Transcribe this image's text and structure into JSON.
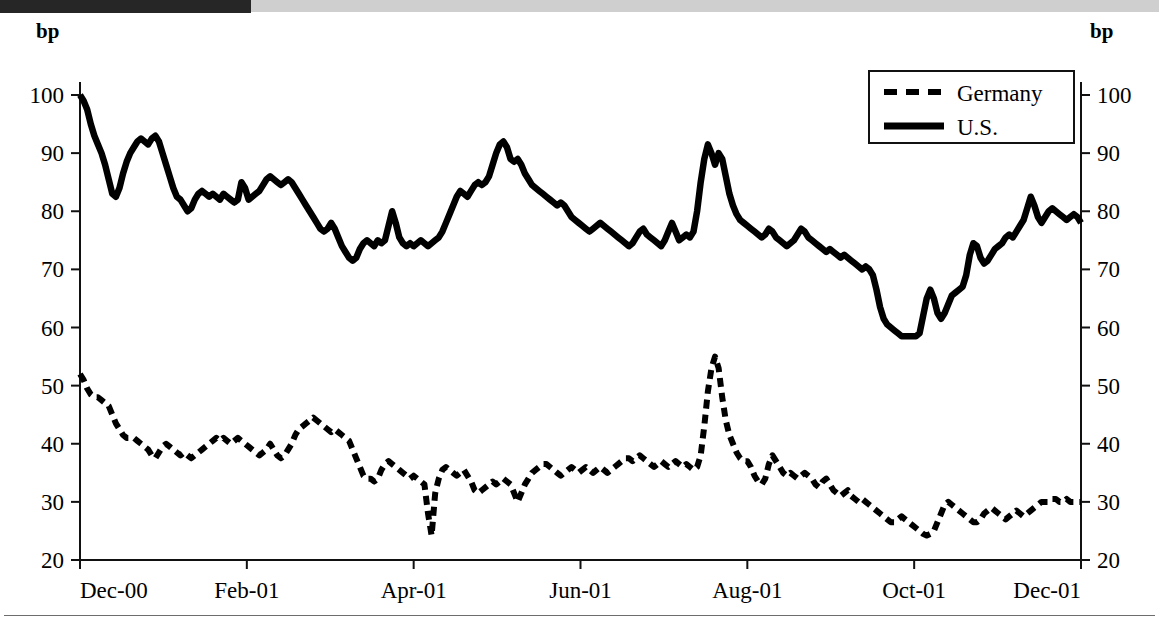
{
  "titlebar": {
    "obscured_text": "",
    "dark_block_color": "#262626",
    "band_color": "#cfcfcf"
  },
  "chart_data": {
    "type": "line",
    "title": "",
    "subtitle": "",
    "xlabel": "",
    "ylabel": "bp",
    "ylabel_right": "bp",
    "ylim": [
      20,
      100
    ],
    "yticks": [
      20,
      30,
      40,
      50,
      60,
      70,
      80,
      90,
      100
    ],
    "ytick_labels": [
      "20",
      "30",
      "40",
      "50",
      "60",
      "70",
      "80",
      "90",
      "100"
    ],
    "ytick_labels_right": [
      "20",
      "30",
      "40",
      "50",
      "60",
      "70",
      "80",
      "90",
      "100"
    ],
    "xtick_labels": [
      "Dec-00",
      "Feb-01",
      "Apr-01",
      "Jun-01",
      "Aug-01",
      "Oct-01",
      "Dec-01"
    ],
    "xlim": [
      0,
      12
    ],
    "grid": false,
    "legend_position": "top-right",
    "line_color": "#000000",
    "series": [
      {
        "name": "U.S.",
        "style": "solid",
        "values": [
          100.0,
          99.0,
          97.5,
          95.0,
          93.0,
          91.5,
          90.0,
          88.0,
          85.5,
          83.0,
          82.5,
          84.0,
          86.5,
          88.5,
          90.0,
          91.0,
          92.0,
          92.5,
          92.0,
          91.5,
          92.5,
          93.0,
          92.0,
          90.0,
          88.0,
          86.0,
          84.0,
          82.5,
          82.0,
          81.0,
          80.0,
          80.5,
          82.0,
          83.0,
          83.5,
          83.0,
          82.5,
          83.0,
          82.5,
          82.0,
          83.0,
          82.5,
          82.0,
          81.5,
          82.0,
          85.0,
          84.0,
          82.0,
          82.5,
          83.0,
          83.5,
          84.5,
          85.5,
          86.0,
          85.5,
          85.0,
          84.5,
          85.0,
          85.5,
          85.0,
          84.0,
          83.0,
          82.0,
          81.0,
          80.0,
          79.0,
          78.0,
          77.0,
          76.5,
          77.0,
          78.0,
          77.0,
          75.5,
          74.0,
          73.0,
          72.0,
          71.5,
          72.0,
          73.5,
          74.5,
          75.0,
          74.5,
          74.0,
          75.0,
          74.5,
          75.0,
          77.5,
          80.0,
          78.0,
          75.5,
          74.5,
          74.0,
          74.5,
          74.0,
          74.5,
          75.0,
          74.5,
          74.0,
          74.5,
          75.0,
          75.5,
          76.5,
          78.0,
          79.5,
          81.0,
          82.5,
          83.5,
          83.0,
          82.5,
          83.5,
          84.5,
          85.0,
          84.5,
          85.0,
          86.0,
          88.0,
          90.0,
          91.5,
          92.0,
          91.0,
          89.0,
          88.5,
          89.0,
          88.0,
          86.5,
          85.5,
          84.5,
          84.0,
          83.5,
          83.0,
          82.5,
          82.0,
          81.5,
          81.0,
          81.5,
          81.0,
          80.0,
          79.0,
          78.5,
          78.0,
          77.5,
          77.0,
          76.5,
          77.0,
          77.5,
          78.0,
          77.5,
          77.0,
          76.5,
          76.0,
          75.5,
          75.0,
          74.5,
          74.0,
          74.5,
          75.5,
          76.5,
          77.0,
          76.0,
          75.5,
          75.0,
          74.5,
          74.0,
          75.0,
          76.5,
          78.0,
          76.5,
          75.0,
          75.5,
          76.0,
          75.5,
          76.5,
          80.0,
          85.0,
          89.0,
          91.5,
          90.0,
          88.0,
          90.0,
          89.0,
          86.0,
          83.0,
          81.0,
          79.5,
          78.5,
          78.0,
          77.5,
          77.0,
          76.5,
          76.0,
          75.5,
          76.0,
          77.0,
          76.5,
          75.5,
          75.0,
          74.5,
          74.0,
          74.5,
          75.0,
          76.0,
          77.0,
          76.5,
          75.5,
          75.0,
          74.5,
          74.0,
          73.5,
          73.0,
          73.5,
          73.0,
          72.5,
          72.0,
          72.5,
          72.0,
          71.5,
          71.0,
          70.5,
          70.0,
          70.5,
          70.0,
          69.0,
          66.5,
          63.5,
          61.5,
          60.5,
          60.0,
          59.5,
          59.0,
          58.5,
          58.5,
          58.5,
          58.5,
          58.5,
          59.0,
          62.0,
          65.0,
          66.5,
          65.0,
          62.5,
          61.5,
          62.5,
          64.0,
          65.5,
          66.0,
          66.5,
          67.0,
          69.0,
          72.5,
          74.5,
          74.0,
          72.0,
          71.0,
          71.5,
          72.5,
          73.5,
          74.0,
          74.5,
          75.5,
          76.0,
          75.5,
          76.5,
          77.5,
          78.5,
          80.5,
          82.5,
          81.0,
          79.0,
          78.0,
          79.0,
          80.0,
          80.5,
          80.0,
          79.5,
          79.0,
          78.5,
          79.0,
          79.5,
          79.0,
          78.0
        ]
      },
      {
        "name": "Germany",
        "style": "dashed",
        "values": [
          52.0,
          51.0,
          49.5,
          48.5,
          48.0,
          48.0,
          47.5,
          47.0,
          46.5,
          45.0,
          43.5,
          42.5,
          41.5,
          41.0,
          41.0,
          41.0,
          40.5,
          40.0,
          39.5,
          39.0,
          38.0,
          37.5,
          38.5,
          39.5,
          40.0,
          39.5,
          39.0,
          38.5,
          38.0,
          38.5,
          38.0,
          37.5,
          38.0,
          38.5,
          39.0,
          39.5,
          40.0,
          40.5,
          41.0,
          40.5,
          41.0,
          40.5,
          40.0,
          40.5,
          41.0,
          40.5,
          40.0,
          39.5,
          39.0,
          38.5,
          38.0,
          38.5,
          39.0,
          40.0,
          39.0,
          38.0,
          37.5,
          38.0,
          39.0,
          40.0,
          41.5,
          42.5,
          43.0,
          43.5,
          44.0,
          44.5,
          44.0,
          43.5,
          43.0,
          42.5,
          42.0,
          42.5,
          42.0,
          41.5,
          41.0,
          40.5,
          39.0,
          37.5,
          36.0,
          34.5,
          34.0,
          34.0,
          33.5,
          34.0,
          35.5,
          36.5,
          37.0,
          36.5,
          36.0,
          35.5,
          35.0,
          34.5,
          34.0,
          34.5,
          34.0,
          33.5,
          33.0,
          28.0,
          24.2,
          31.5,
          34.0,
          35.5,
          36.0,
          35.5,
          35.0,
          34.5,
          35.0,
          35.5,
          34.5,
          33.5,
          32.0,
          31.5,
          32.0,
          32.5,
          33.0,
          33.5,
          33.0,
          33.5,
          34.0,
          33.5,
          33.0,
          31.5,
          30.0,
          31.5,
          33.0,
          34.0,
          35.0,
          35.5,
          36.0,
          36.5,
          36.5,
          36.0,
          35.5,
          35.0,
          34.5,
          35.0,
          35.5,
          36.0,
          35.5,
          35.0,
          35.5,
          36.0,
          35.5,
          35.0,
          35.5,
          36.0,
          35.5,
          35.0,
          35.5,
          36.0,
          36.5,
          37.0,
          37.5,
          37.5,
          37.0,
          37.5,
          38.0,
          37.5,
          37.0,
          36.5,
          36.0,
          36.5,
          37.0,
          36.5,
          36.0,
          36.5,
          37.0,
          36.5,
          36.0,
          36.5,
          36.0,
          35.5,
          36.0,
          38.0,
          43.0,
          49.0,
          53.0,
          55.0,
          53.0,
          48.0,
          44.0,
          41.5,
          40.0,
          38.5,
          37.5,
          37.0,
          37.0,
          36.0,
          34.5,
          33.5,
          33.0,
          34.0,
          36.5,
          38.0,
          37.0,
          36.0,
          35.0,
          34.5,
          35.0,
          34.5,
          34.0,
          34.5,
          35.0,
          34.5,
          34.0,
          33.0,
          32.5,
          33.5,
          34.0,
          33.0,
          32.0,
          31.5,
          31.0,
          31.5,
          32.0,
          31.0,
          30.5,
          30.0,
          30.5,
          30.0,
          29.5,
          29.0,
          28.5,
          28.0,
          27.5,
          27.0,
          26.5,
          26.5,
          27.0,
          27.5,
          27.0,
          26.5,
          26.0,
          25.5,
          25.0,
          24.5,
          24.2,
          24.5,
          25.0,
          26.5,
          28.0,
          29.5,
          30.0,
          29.5,
          29.0,
          28.5,
          28.0,
          27.5,
          27.0,
          26.5,
          26.5,
          27.0,
          28.0,
          28.5,
          29.0,
          28.5,
          28.0,
          27.5,
          27.0,
          27.5,
          28.0,
          28.5,
          28.0,
          27.5,
          28.0,
          28.5,
          29.0,
          29.5,
          30.0,
          30.0,
          30.0,
          30.5,
          30.5,
          30.0,
          30.0,
          30.5,
          30.0,
          30.0,
          30.0,
          30.0
        ]
      }
    ],
    "legend": [
      {
        "label": "Germany",
        "style": "dashed"
      },
      {
        "label": "U.S.",
        "style": "solid"
      }
    ]
  }
}
